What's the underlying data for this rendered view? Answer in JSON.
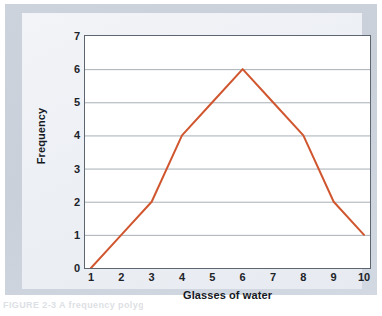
{
  "figure": {
    "caption_stub": "FIGURE 2-3   A frequency polygon",
    "line_color": "#d0562f",
    "plot_background": "#ffffff",
    "grid_color": "#a8aeb5",
    "axis_color": "#5d6670",
    "panel_color": "#eef1f5",
    "mount_color": "#ccd3dd"
  },
  "chart_data": {
    "type": "line",
    "title": "",
    "xlabel": "Glasses of water",
    "ylabel": "Frequency",
    "x": [
      1,
      2,
      3,
      4,
      5,
      6,
      7,
      8,
      9,
      10
    ],
    "values": [
      0,
      1,
      2,
      4,
      5,
      6,
      5,
      4,
      2,
      1
    ],
    "series": [
      {
        "name": "Frequency",
        "values": [
          0,
          1,
          2,
          4,
          5,
          6,
          5,
          4,
          2,
          1
        ]
      }
    ],
    "xlim": [
      1,
      10
    ],
    "ylim": [
      0,
      7
    ],
    "xticks": [
      "1",
      "2",
      "3",
      "4",
      "5",
      "6",
      "7",
      "8",
      "9",
      "10"
    ],
    "yticks": [
      "0",
      "1",
      "2",
      "3",
      "4",
      "5",
      "6",
      "7"
    ],
    "grid": "horizontal",
    "legend": "none",
    "marker": "none"
  }
}
